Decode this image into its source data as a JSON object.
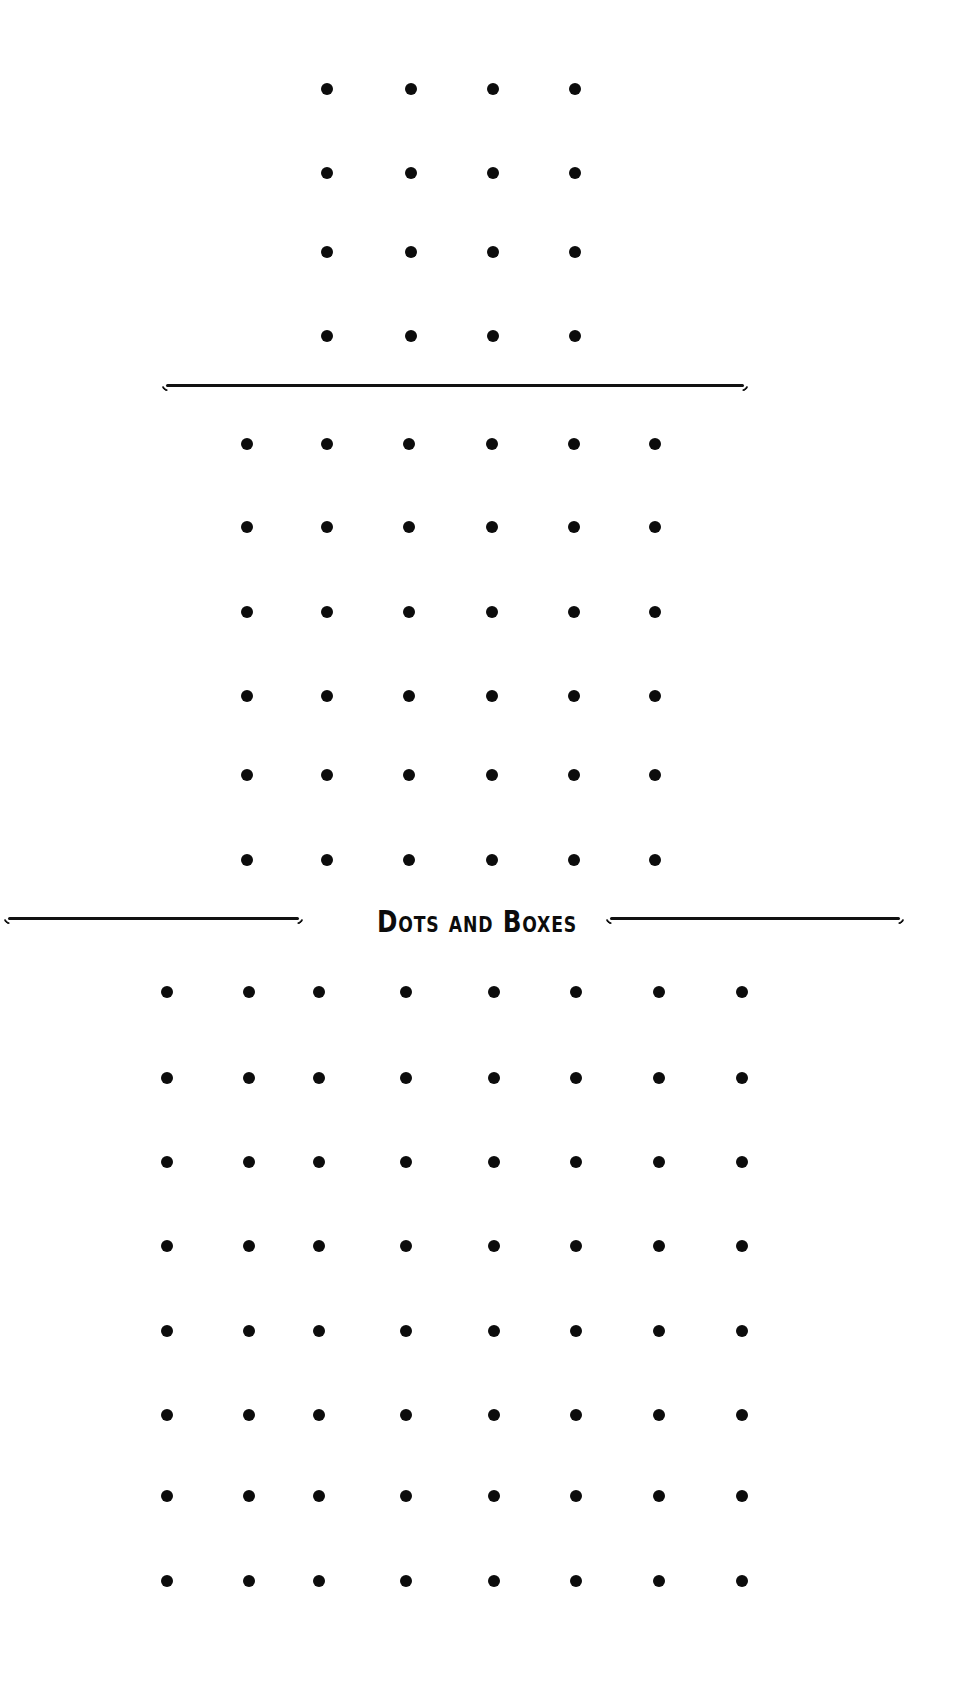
{
  "title": "Dots and Boxes",
  "colors": {
    "dot": "#0c0c0c",
    "background": "#ffffff",
    "rule": "#111111"
  },
  "boards": [
    {
      "name": "small-board",
      "size": "4x4",
      "cols": 4,
      "rows": 4,
      "x": [
        327,
        411,
        493,
        575
      ],
      "y": [
        89,
        173,
        252,
        336
      ]
    },
    {
      "name": "medium-board",
      "size": "6x6",
      "cols": 6,
      "rows": 6,
      "x": [
        247,
        327,
        409,
        492,
        574,
        655
      ],
      "y": [
        444,
        527,
        612,
        696,
        775,
        860
      ]
    },
    {
      "name": "large-board",
      "size": "8x8",
      "cols": 8,
      "rows": 8,
      "x": [
        167,
        249,
        319,
        406,
        494,
        576,
        659,
        742
      ],
      "y": [
        992,
        1078,
        1162,
        1246,
        1331,
        1415,
        1496,
        1581
      ]
    }
  ],
  "rules": [
    {
      "name": "divider-top",
      "left": 166,
      "top": 384,
      "width": 578
    },
    {
      "name": "divider-title-left",
      "left": 8,
      "top": 917,
      "width": 291
    },
    {
      "name": "divider-title-right",
      "left": 610,
      "top": 917,
      "width": 290
    }
  ]
}
